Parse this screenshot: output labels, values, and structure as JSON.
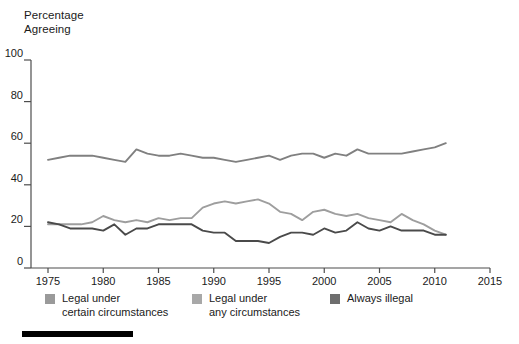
{
  "chart_data": {
    "type": "line",
    "title": "",
    "ylabel": "Percentage\nAgreeing",
    "xlabel": "",
    "ylim": [
      0,
      100
    ],
    "xlim": [
      1975,
      2015
    ],
    "yticks": [
      "0",
      "20",
      "40",
      "60",
      "80",
      "100"
    ],
    "ytick_values": [
      0,
      20,
      40,
      60,
      80,
      100
    ],
    "xticks": [
      "1975",
      "1980",
      "1985",
      "1990",
      "1995",
      "2000",
      "2005",
      "2010",
      "2015"
    ],
    "xtick_values": [
      1975,
      1980,
      1985,
      1990,
      1995,
      2000,
      2005,
      2010,
      2015
    ],
    "grid": false,
    "legend_position": "below",
    "x": [
      1975,
      1976,
      1977,
      1978,
      1979,
      1980,
      1981,
      1982,
      1983,
      1984,
      1985,
      1986,
      1987,
      1988,
      1989,
      1990,
      1991,
      1992,
      1993,
      1994,
      1995,
      1996,
      1997,
      1998,
      1999,
      2000,
      2001,
      2002,
      2003,
      2004,
      2005,
      2006,
      2007,
      2008,
      2009,
      2010,
      2011
    ],
    "series": [
      {
        "name": "Legal under certain circumstances",
        "color": "#808080",
        "values": [
          52,
          53,
          54,
          54,
          54,
          53,
          52,
          51,
          57,
          55,
          54,
          54,
          55,
          54,
          53,
          53,
          52,
          51,
          52,
          53,
          54,
          52,
          54,
          55,
          55,
          53,
          55,
          54,
          57,
          55,
          55,
          55,
          55,
          56,
          57,
          58,
          60
        ]
      },
      {
        "name": "Legal under any circumstances",
        "color": "#9e9e9e",
        "values": [
          21,
          21,
          21,
          21,
          22,
          25,
          23,
          22,
          23,
          22,
          24,
          23,
          24,
          24,
          29,
          31,
          32,
          31,
          32,
          33,
          31,
          27,
          26,
          23,
          27,
          28,
          26,
          25,
          26,
          24,
          23,
          22,
          26,
          23,
          21,
          18,
          16
        ]
      },
      {
        "name": "Always illegal",
        "color": "#4a4a4a",
        "values": [
          22,
          21,
          19,
          19,
          19,
          18,
          21,
          16,
          19,
          19,
          21,
          21,
          21,
          21,
          18,
          17,
          17,
          13,
          13,
          13,
          12,
          15,
          17,
          17,
          16,
          19,
          17,
          18,
          22,
          19,
          18,
          20,
          18,
          18,
          18,
          16,
          16
        ]
      }
    ]
  },
  "legend": {
    "items": [
      {
        "label": "Legal under\ncertain circumstances",
        "color": "#9a9a9a"
      },
      {
        "label": "Legal under\nany circumstances",
        "color": "#a8a8a8"
      },
      {
        "label": "Always illegal",
        "color": "#6e6e6e"
      }
    ]
  },
  "axis": {
    "y_title": "Percentage\nAgreeing",
    "spine_color": "#4d4d4d"
  }
}
